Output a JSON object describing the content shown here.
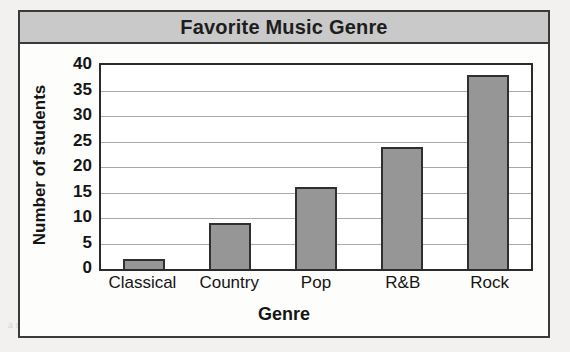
{
  "chart_data": {
    "type": "bar",
    "title": "Favorite Music Genre",
    "xlabel": "Genre",
    "ylabel": "Number of students",
    "categories": [
      "Classical",
      "Country",
      "Pop",
      "R&B",
      "Rock"
    ],
    "values": [
      2,
      9,
      16,
      24,
      38
    ],
    "ylim": [
      0,
      40
    ],
    "ytick_values": [
      0,
      5,
      10,
      15,
      20,
      25,
      30,
      35,
      40
    ],
    "ytick_labels": [
      "0",
      "5",
      "10",
      "15",
      "20",
      "25",
      "30",
      "35",
      "40"
    ],
    "grid": "horizontal",
    "legend": "none",
    "bar_color": "#969696",
    "bar_border_color": "#2f2f2f",
    "title_band_color": "#c9c9c9",
    "frame_color": "#3a3a3a",
    "gridline_color": "#a9a9a9",
    "plot_background": "#ffffff"
  },
  "background": {
    "bleed_text": [
      "a scanned page artifact",
      "a the r chart a",
      "n = answer the questions"
    ]
  }
}
